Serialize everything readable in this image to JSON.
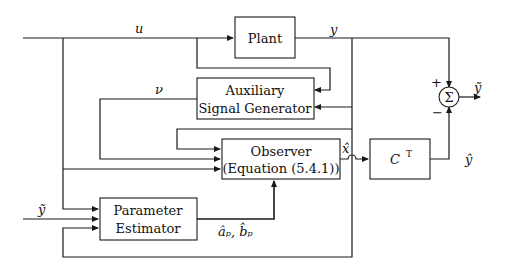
{
  "diagram": {
    "type": "block-diagram",
    "blocks": {
      "plant": {
        "label": "Plant"
      },
      "aux": {
        "line1": "Auxiliary",
        "line2": "Signal Generator"
      },
      "observer": {
        "line1": "Observer",
        "line2": "(Equation (5.4.1))"
      },
      "ct": {
        "label": "C",
        "sup": "T"
      },
      "estimator": {
        "line1": "Parameter",
        "line2": "Estimator"
      },
      "sum": {
        "label": "Σ",
        "plus": "+",
        "minus": "−"
      }
    },
    "signals": {
      "u": "u",
      "y": "y",
      "nu": "ν",
      "x_hat": "x̂",
      "y_tilde_out": "ỹ",
      "y_hat": "ŷ",
      "y_tilde_in": "ỹ",
      "params": "âₚ, b̂ₚ"
    }
  }
}
